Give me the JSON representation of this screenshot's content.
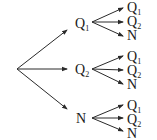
{
  "diagram": {
    "type": "tree",
    "colors": {
      "line": "#2a2a2a",
      "text": "#1a1a1a",
      "background": "#ffffff"
    },
    "root": {
      "x": 17,
      "y": 69
    },
    "level1": [
      {
        "label": "Q",
        "sub": "1",
        "x": 75,
        "y": 28,
        "arrow_end": [
          67,
          30
        ],
        "fork": [
          92,
          22
        ]
      },
      {
        "label": "Q",
        "sub": "2",
        "x": 75,
        "y": 74,
        "arrow_end": [
          67,
          69
        ],
        "fork": [
          92,
          69
        ]
      },
      {
        "label": "N",
        "sub": "",
        "x": 76,
        "y": 123,
        "arrow_end": [
          67,
          109
        ],
        "fork": [
          92,
          118
        ]
      }
    ],
    "level2": [
      [
        {
          "label": "Q",
          "sub": "1",
          "x": 127,
          "y": 12,
          "end": [
            123,
            8
          ]
        },
        {
          "label": "Q",
          "sub": "2",
          "x": 127,
          "y": 26,
          "end": [
            123,
            22
          ]
        },
        {
          "label": "N",
          "sub": "",
          "x": 127,
          "y": 40,
          "end": [
            123,
            36
          ]
        }
      ],
      [
        {
          "label": "Q",
          "sub": "1",
          "x": 127,
          "y": 61,
          "end": [
            123,
            56
          ]
        },
        {
          "label": "Q",
          "sub": "2",
          "x": 127,
          "y": 75,
          "end": [
            123,
            70
          ]
        },
        {
          "label": "N",
          "sub": "",
          "x": 127,
          "y": 89,
          "end": [
            123,
            84
          ]
        }
      ],
      [
        {
          "label": "Q",
          "sub": "1",
          "x": 127,
          "y": 110,
          "end": [
            123,
            105
          ]
        },
        {
          "label": "Q",
          "sub": "2",
          "x": 127,
          "y": 124,
          "end": [
            123,
            118
          ]
        },
        {
          "label": "N",
          "sub": "",
          "x": 127,
          "y": 138,
          "end": [
            123,
            131
          ]
        }
      ]
    ]
  }
}
